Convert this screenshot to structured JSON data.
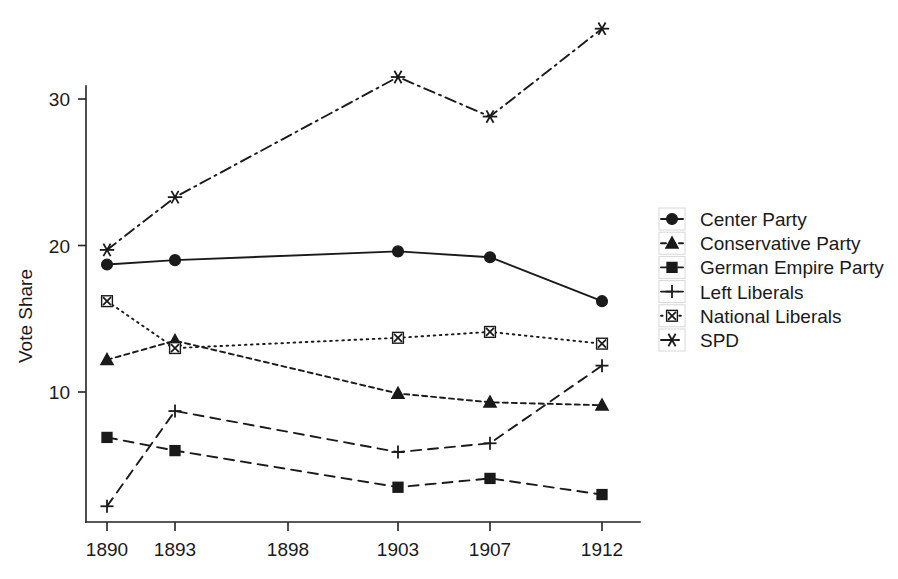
{
  "chart_data": {
    "type": "line",
    "title": "",
    "xlabel": "",
    "ylabel": "Vote Share",
    "categories": [
      "1890",
      "1893",
      "1898",
      "1903",
      "1907",
      "1912"
    ],
    "x_tick_labels": [
      "1890",
      "1893",
      "1898",
      "1903",
      "1907",
      "1912"
    ],
    "y_tick_labels": [
      "10",
      "20",
      "30"
    ],
    "y_ticks": [
      10,
      20,
      30
    ],
    "ylim": [
      0.5,
      35.5
    ],
    "grid": false,
    "legend_position": "right",
    "series": [
      {
        "name": "Center Party",
        "marker": "circle",
        "linestyle": "solid",
        "values": [
          18.7,
          19.0,
          null,
          19.6,
          19.2,
          16.2
        ]
      },
      {
        "name": "Conservative Party",
        "marker": "triangle",
        "linestyle": "dashed",
        "values": [
          12.2,
          13.5,
          null,
          9.9,
          9.3,
          9.1
        ]
      },
      {
        "name": "German Empire Party",
        "marker": "square",
        "linestyle": "long-dash",
        "values": [
          6.9,
          6.0,
          null,
          3.5,
          4.1,
          3.0
        ]
      },
      {
        "name": "Left Liberals",
        "marker": "plus",
        "linestyle": "long-dash",
        "values": [
          2.2,
          8.7,
          null,
          5.9,
          6.5,
          11.8
        ]
      },
      {
        "name": "National Liberals",
        "marker": "boxed-cross",
        "linestyle": "dotted",
        "values": [
          16.2,
          13.0,
          null,
          13.7,
          14.1,
          13.3
        ]
      },
      {
        "name": "SPD",
        "marker": "asterisk",
        "linestyle": "dash-dot",
        "values": [
          19.7,
          23.3,
          null,
          31.5,
          28.8,
          34.8
        ]
      }
    ]
  },
  "axis": {
    "y_title": "Vote Share"
  },
  "legend": {
    "entries": [
      {
        "label": "Center Party",
        "icon": "filled-circle-marker-icon"
      },
      {
        "label": "Conservative Party",
        "icon": "filled-triangle-marker-icon"
      },
      {
        "label": "German Empire Party",
        "icon": "filled-square-marker-icon"
      },
      {
        "label": "Left Liberals",
        "icon": "plus-marker-icon"
      },
      {
        "label": "National Liberals",
        "icon": "boxed-cross-marker-icon"
      },
      {
        "label": "SPD",
        "icon": "asterisk-marker-icon"
      }
    ]
  },
  "colors": {
    "foreground": "#1a1a1a",
    "background": "#ffffff",
    "axis": "#222222"
  }
}
